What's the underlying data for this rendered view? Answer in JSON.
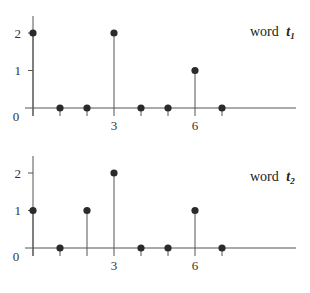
{
  "chart_data": [
    {
      "type": "stem",
      "title": "word t1",
      "label_word": "word",
      "label_var": "t",
      "label_sub": "1",
      "x": [
        0,
        1,
        2,
        3,
        4,
        5,
        6,
        7
      ],
      "values": [
        2,
        0,
        0,
        2,
        0,
        0,
        1,
        0
      ],
      "xticks": [
        {
          "value": 3,
          "label": "3"
        },
        {
          "value": 6,
          "label": "6"
        }
      ],
      "yticks": [
        {
          "value": 1,
          "label": "1"
        },
        {
          "value": 2,
          "label": "2"
        }
      ],
      "origin_label": "0",
      "ylim": [
        0,
        2.5
      ],
      "xlim": [
        0,
        10.3
      ],
      "grid": false
    },
    {
      "type": "stem",
      "title": "word t2",
      "label_word": "word",
      "label_var": "t",
      "label_sub": "2",
      "x": [
        0,
        1,
        2,
        3,
        4,
        5,
        6,
        7
      ],
      "values": [
        1,
        0,
        1,
        2,
        0,
        0,
        1,
        0
      ],
      "xticks": [
        {
          "value": 3,
          "label": "3"
        },
        {
          "value": 6,
          "label": "6"
        }
      ],
      "yticks": [
        {
          "value": 1,
          "label": "1"
        },
        {
          "value": 2,
          "label": "2"
        }
      ],
      "origin_label": "0",
      "ylim": [
        0,
        2.5
      ],
      "xlim": [
        0,
        10.3
      ],
      "grid": false
    }
  ],
  "style": {
    "line_color": "#555555",
    "dot_color": "#2a2a2a",
    "text_color": "#333333"
  }
}
